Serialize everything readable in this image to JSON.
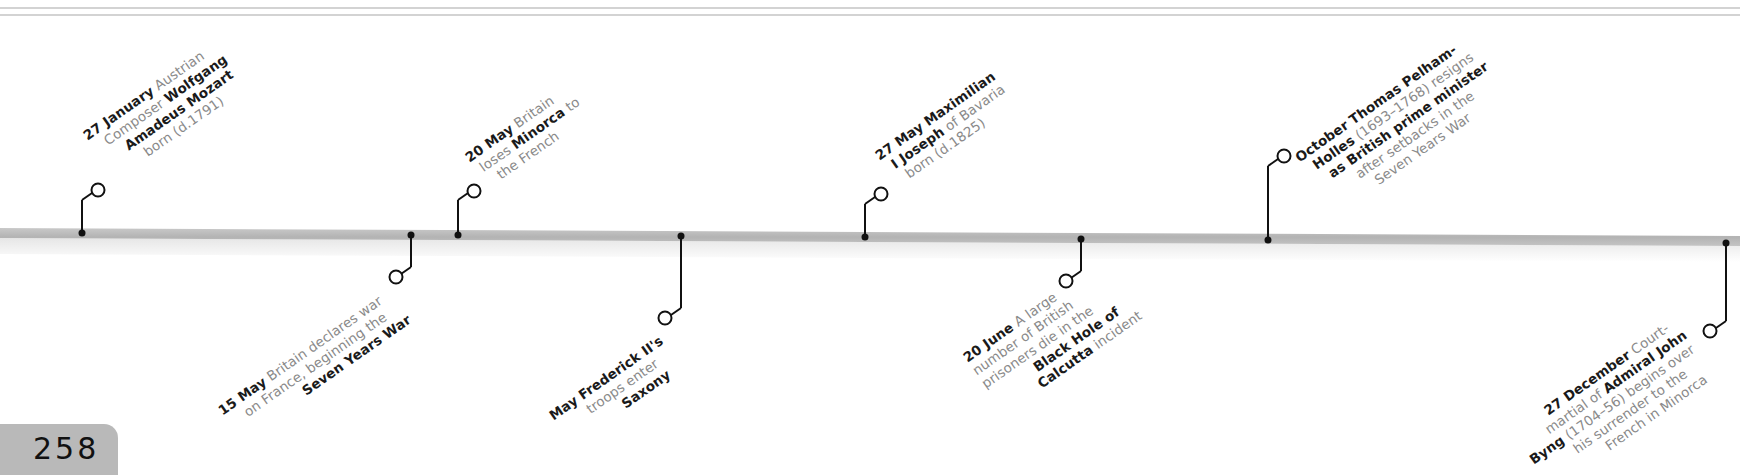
{
  "page": {
    "number": "258",
    "accent_bar_color": "#bdbdbd",
    "marker_color": "#111111",
    "bold_text_color": "#1a1a1a",
    "light_text_color": "#8a8a8a"
  },
  "timeline": {
    "events": [
      {
        "id": "mozart",
        "side": "above",
        "date": "27 January",
        "lines": [
          [
            {
              "t": "27 January",
              "b": true
            },
            {
              "t": " Austrian",
              "b": false
            }
          ],
          [
            {
              "t": "Composer ",
              "b": false
            },
            {
              "t": "Wolfgang",
              "b": true
            }
          ],
          [
            {
              "t": "Amadeus Mozart",
              "b": true
            }
          ],
          [
            {
              "t": "born (d.1791)",
              "b": false
            }
          ]
        ]
      },
      {
        "id": "war-declared",
        "side": "below",
        "date": "15 May",
        "lines": [
          [
            {
              "t": "15 May",
              "b": true
            },
            {
              "t": " Britain declares war",
              "b": false
            }
          ],
          [
            {
              "t": "on France, beginning the",
              "b": false
            }
          ],
          [
            {
              "t": "Seven Years War",
              "b": true
            }
          ]
        ]
      },
      {
        "id": "minorca",
        "side": "above",
        "date": "20 May",
        "lines": [
          [
            {
              "t": "20 May",
              "b": true
            },
            {
              "t": " Britain",
              "b": false
            }
          ],
          [
            {
              "t": "loses ",
              "b": false
            },
            {
              "t": "Minorca",
              "b": true
            },
            {
              "t": " to",
              "b": false
            }
          ],
          [
            {
              "t": "the French",
              "b": false
            }
          ]
        ]
      },
      {
        "id": "saxony",
        "side": "below",
        "date": "May",
        "lines": [
          [
            {
              "t": "May",
              "b": true
            },
            {
              "t": " ",
              "b": false
            },
            {
              "t": "Frederick II's",
              "b": true
            }
          ],
          [
            {
              "t": "troops enter",
              "b": false
            }
          ],
          [
            {
              "t": "Saxony",
              "b": true
            }
          ]
        ]
      },
      {
        "id": "maximilian",
        "side": "above",
        "date": "27 May",
        "lines": [
          [
            {
              "t": "27 May",
              "b": true
            },
            {
              "t": " ",
              "b": false
            },
            {
              "t": "Maximilian",
              "b": true
            }
          ],
          [
            {
              "t": "I Joseph",
              "b": true
            },
            {
              "t": " of Bavaria",
              "b": false
            }
          ],
          [
            {
              "t": "born (d.1825)",
              "b": false
            }
          ]
        ]
      },
      {
        "id": "calcutta",
        "side": "below",
        "date": "20 June",
        "lines": [
          [
            {
              "t": "20 June",
              "b": true
            },
            {
              "t": " A large",
              "b": false
            }
          ],
          [
            {
              "t": "number of British",
              "b": false
            }
          ],
          [
            {
              "t": "prisoners die in the",
              "b": false
            }
          ],
          [
            {
              "t": "Black Hole of",
              "b": true
            }
          ],
          [
            {
              "t": "Calcutta",
              "b": true
            },
            {
              "t": " incident",
              "b": false
            }
          ]
        ]
      },
      {
        "id": "pelham-holles",
        "side": "above",
        "date": "October",
        "lines": [
          [
            {
              "t": "October",
              "b": true
            },
            {
              "t": " ",
              "b": false
            },
            {
              "t": "Thomas Pelham-",
              "b": true
            }
          ],
          [
            {
              "t": "Holles",
              "b": true
            },
            {
              "t": " (1693–1768) resigns",
              "b": false
            }
          ],
          [
            {
              "t": "as British prime minister",
              "b": true
            }
          ],
          [
            {
              "t": "after setbacks in the",
              "b": false
            }
          ],
          [
            {
              "t": "Seven Years War",
              "b": false
            }
          ]
        ]
      },
      {
        "id": "byng",
        "side": "below",
        "date": "27 December",
        "lines": [
          [
            {
              "t": "27 December",
              "b": true
            },
            {
              "t": " Court-",
              "b": false
            }
          ],
          [
            {
              "t": "martial of ",
              "b": false
            },
            {
              "t": "Admiral John",
              "b": true
            }
          ],
          [
            {
              "t": "Byng",
              "b": true
            },
            {
              "t": " (1704–56) begins over",
              "b": false
            }
          ],
          [
            {
              "t": "his surrender to the",
              "b": false
            }
          ],
          [
            {
              "t": "French in Minorca",
              "b": false
            }
          ]
        ]
      }
    ]
  }
}
